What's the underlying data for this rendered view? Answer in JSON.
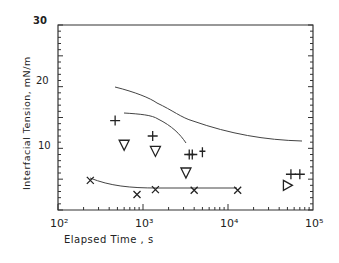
{
  "chart_data": {
    "type": "scatter",
    "title": "",
    "xlabel": "Elapsed Time , s",
    "ylabel": "Interfacial Tension, mN/m",
    "xscale": "log",
    "xlim": [
      100,
      100000
    ],
    "ylim": [
      0,
      30
    ],
    "x_tick_labels": [
      "10²",
      "10³",
      "10⁴",
      "10⁵"
    ],
    "y_tick_labels": [
      "10",
      "20",
      "30"
    ],
    "grid": false,
    "series": [
      {
        "name": "plus",
        "marker": "+",
        "x": [
          470,
          1300,
          3500,
          3800,
          55000,
          70000
        ],
        "y": [
          14.5,
          12,
          9,
          9,
          5.8,
          5.8
        ]
      },
      {
        "name": "dagger",
        "marker": "†",
        "x": [
          5000
        ],
        "y": [
          9.2
        ]
      },
      {
        "name": "down-triangle",
        "marker": "∇",
        "x": [
          600,
          1400,
          3200
        ],
        "y": [
          10.5,
          9.5,
          6
        ]
      },
      {
        "name": "right-triangle",
        "marker": "▷",
        "x": [
          50000
        ],
        "y": [
          4
        ]
      },
      {
        "name": "cross",
        "marker": "×",
        "x": [
          240,
          850,
          1400,
          4000,
          13000
        ],
        "y": [
          4.8,
          2.5,
          3.3,
          3.2,
          3.2
        ]
      }
    ]
  }
}
